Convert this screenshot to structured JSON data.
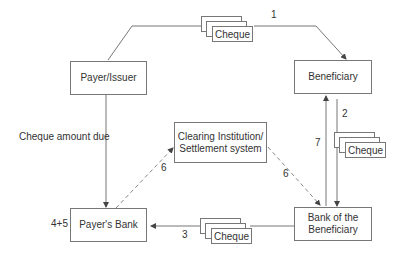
{
  "diagram": {
    "nodes": {
      "payer": "Payer/Issuer",
      "beneficiary": "Beneficiary",
      "clearing_line1": "Clearing Institution/",
      "clearing_line2": "Settlement system",
      "payers_bank": "Payer's Bank",
      "bank_beneficiary_line1": "Bank of the",
      "bank_beneficiary_line2": "Beneficiary"
    },
    "cheque_label": "Cheque",
    "labels": {
      "step1": "1",
      "step2": "2",
      "step3": "3",
      "step45": "4+5",
      "step6_left": "6",
      "step6_right": "6",
      "step7": "7",
      "amount_due": "Cheque amount due"
    },
    "edges": [
      {
        "from": "Payer/Issuer",
        "to": "Beneficiary",
        "label": "1",
        "style": "solid",
        "carries": "Cheque"
      },
      {
        "from": "Beneficiary",
        "to": "Bank of the Beneficiary",
        "label": "2",
        "style": "solid",
        "carries": "Cheque"
      },
      {
        "from": "Bank of the Beneficiary",
        "to": "Payer's Bank",
        "label": "3",
        "style": "solid",
        "carries": "Cheque"
      },
      {
        "from": "Payer/Issuer",
        "to": "Payer's Bank",
        "label": "Cheque amount due",
        "style": "solid"
      },
      {
        "from": "Payer's Bank",
        "to": "Clearing Institution/Settlement system",
        "label": "6",
        "style": "dashed"
      },
      {
        "from": "Clearing Institution/Settlement system",
        "to": "Bank of the Beneficiary",
        "label": "6",
        "style": "dashed"
      },
      {
        "from": "Bank of the Beneficiary",
        "to": "Beneficiary",
        "label": "7",
        "style": "solid"
      }
    ]
  }
}
